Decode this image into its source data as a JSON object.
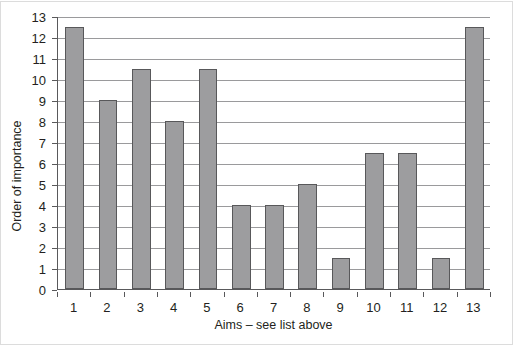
{
  "chart_data": {
    "type": "bar",
    "title": "",
    "subtitle": "",
    "xlabel": "Aims – see list above",
    "ylabel": "Order of importance",
    "categories": [
      "1",
      "2",
      "3",
      "4",
      "5",
      "6",
      "7",
      "8",
      "9",
      "10",
      "11",
      "12",
      "13"
    ],
    "values": [
      12.5,
      9,
      10.5,
      8,
      10.5,
      4,
      4,
      5,
      1.5,
      6.5,
      6.5,
      1.5,
      12.5
    ],
    "series": [
      {
        "name": "Order of importance",
        "values": [
          12.5,
          9,
          10.5,
          8,
          10.5,
          4,
          4,
          5,
          1.5,
          6.5,
          6.5,
          1.5,
          12.5
        ]
      }
    ],
    "ylim": [
      0,
      13
    ],
    "y_ticks": [
      "0",
      "1",
      "2",
      "3",
      "4",
      "5",
      "6",
      "7",
      "8",
      "9",
      "10",
      "11",
      "12",
      "13"
    ],
    "y_tick_values": [
      0,
      1,
      2,
      3,
      4,
      5,
      6,
      7,
      8,
      9,
      10,
      11,
      12,
      13
    ],
    "grid": "horizontal",
    "legend": "none",
    "bar_fill_color": "#9d9d9f",
    "bar_border_color": "#58585a",
    "gridline_color": "#9a9a9c",
    "axis_color": "#59595b",
    "text_color": "#231f20",
    "background_color": "#ffffff"
  }
}
